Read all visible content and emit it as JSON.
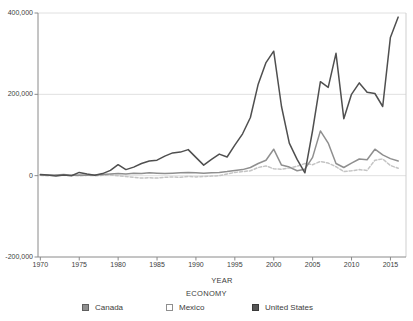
{
  "chart_data": {
    "type": "line",
    "xlabel": "YEAR",
    "legend_title": "ECONOMY",
    "legend_position": "bottom",
    "grid": true,
    "xlim": [
      1969.7,
      2017.0
    ],
    "ylim": [
      -200000,
      400000
    ],
    "xticks": [
      1970,
      1975,
      1980,
      1985,
      1990,
      1995,
      2000,
      2005,
      2010,
      2015
    ],
    "yticks": [
      {
        "value": 400000,
        "label": "400,000"
      },
      {
        "value": 200000,
        "label": "200,000"
      },
      {
        "value": 0,
        "label": "0"
      },
      {
        "value": -200000,
        "label": "-200,000"
      }
    ],
    "x": [
      1970,
      1971,
      1972,
      1973,
      1974,
      1975,
      1976,
      1977,
      1978,
      1979,
      1980,
      1981,
      1982,
      1983,
      1984,
      1985,
      1986,
      1987,
      1988,
      1989,
      1990,
      1991,
      1992,
      1993,
      1994,
      1995,
      1996,
      1997,
      1998,
      1999,
      2000,
      2001,
      2002,
      2003,
      2004,
      2005,
      2006,
      2007,
      2008,
      2009,
      2010,
      2011,
      2012,
      2013,
      2014,
      2015,
      2016
    ],
    "series": [
      {
        "name": "Canada",
        "color": "#8f8f8f",
        "dash": "",
        "swatch_fill": "#8f8f8f",
        "swatch_border": "#5f5f5f",
        "values": [
          2000,
          1000,
          2000,
          3000,
          1000,
          2000,
          1000,
          2000,
          3000,
          4000,
          5000,
          4000,
          6000,
          5000,
          7000,
          6000,
          5000,
          6000,
          7000,
          8000,
          7000,
          6000,
          7000,
          8000,
          10000,
          13000,
          15000,
          20000,
          30000,
          38000,
          65000,
          26000,
          21000,
          12000,
          16000,
          45000,
          110000,
          80000,
          30000,
          20000,
          31000,
          41000,
          39000,
          65000,
          51000,
          42000,
          36000
        ]
      },
      {
        "name": "Mexico",
        "color": "#c4c4c4",
        "dash": "3,2",
        "swatch_fill": "#ffffff",
        "swatch_border": "#8f8f8f",
        "values": [
          1000,
          0,
          1000,
          2000,
          1000,
          0,
          1000,
          0,
          1000,
          2000,
          0,
          -2000,
          -4000,
          -6000,
          -5000,
          -6000,
          -4000,
          -3000,
          -4000,
          -2000,
          -3000,
          -2000,
          -1000,
          0,
          4000,
          8000,
          10000,
          12000,
          20000,
          24000,
          17000,
          16000,
          19000,
          23000,
          30000,
          27000,
          35000,
          31000,
          22000,
          10000,
          12000,
          15000,
          13000,
          38000,
          41000,
          25000,
          18000
        ]
      },
      {
        "name": "United States",
        "color": "#4f4f4f",
        "dash": "",
        "swatch_fill": "#565656",
        "swatch_border": "#3a3a3a",
        "values": [
          3000,
          2000,
          -1000,
          2000,
          0,
          8000,
          4000,
          1000,
          5000,
          13000,
          27000,
          15000,
          21000,
          30000,
          36000,
          38000,
          48000,
          56000,
          58000,
          64000,
          45000,
          26000,
          40000,
          53000,
          46000,
          75000,
          103000,
          143000,
          225000,
          278000,
          306000,
          170000,
          80000,
          40000,
          7000,
          111000,
          231000,
          217000,
          301000,
          140000,
          200000,
          228000,
          205000,
          202000,
          170000,
          340000,
          390000
        ]
      }
    ]
  },
  "colors": {
    "background": "#ffffff",
    "grid": "#e0e0e0",
    "axis": "#8a8a8a",
    "plot_border": "#cfcfcf",
    "text": "#3d3d3d"
  }
}
